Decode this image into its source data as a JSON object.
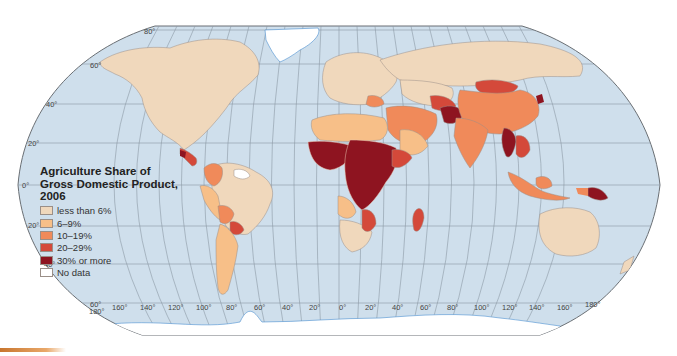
{
  "legend": {
    "title": "Agriculture Share of Gross Domestic Product, 2006",
    "title_lines": [
      "Agriculture Share of",
      "Gross Domestic Product,",
      "2006"
    ],
    "items": [
      {
        "label": "less than 6%",
        "color": "#f0d8bc"
      },
      {
        "label": "6–9%",
        "color": "#f7bf88"
      },
      {
        "label": "10–19%",
        "color": "#f08a5a"
      },
      {
        "label": "20–29%",
        "color": "#d4493a"
      },
      {
        "label": "30% or more",
        "color": "#8e1420"
      },
      {
        "label": "No data",
        "color": "#ffffff"
      }
    ]
  },
  "map": {
    "ocean_color": "#cfdfec",
    "graticule_color": "#8c98a4",
    "coast_color": "#4a8fd0",
    "latitude_labels": [
      {
        "label": "80°",
        "x": 144,
        "y": 34
      },
      {
        "label": "60°",
        "x": 90,
        "y": 68
      },
      {
        "label": "40°",
        "x": 46,
        "y": 107
      },
      {
        "label": "20°",
        "x": 28,
        "y": 145
      },
      {
        "label": "0°",
        "x": 22,
        "y": 188
      },
      {
        "label": "20°",
        "x": 28,
        "y": 228
      },
      {
        "label": "40°",
        "x": 44,
        "y": 267
      },
      {
        "label": "60°",
        "x": 90,
        "y": 306
      }
    ],
    "longitude_labels": [
      {
        "label": "180°",
        "x": 89,
        "y": 313
      },
      {
        "label": "160°",
        "x": 112,
        "y": 310
      },
      {
        "label": "140°",
        "x": 140,
        "y": 310
      },
      {
        "label": "120°",
        "x": 168,
        "y": 310
      },
      {
        "label": "100°",
        "x": 196,
        "y": 310
      },
      {
        "label": "80°",
        "x": 226,
        "y": 310
      },
      {
        "label": "60°",
        "x": 254,
        "y": 310
      },
      {
        "label": "40°",
        "x": 282,
        "y": 310
      },
      {
        "label": "20°",
        "x": 309,
        "y": 310
      },
      {
        "label": "0°",
        "x": 339,
        "y": 310
      },
      {
        "label": "20°",
        "x": 365,
        "y": 310
      },
      {
        "label": "40°",
        "x": 392,
        "y": 310
      },
      {
        "label": "60°",
        "x": 420,
        "y": 310
      },
      {
        "label": "80°",
        "x": 447,
        "y": 310
      },
      {
        "label": "100°",
        "x": 474,
        "y": 310
      },
      {
        "label": "120°",
        "x": 502,
        "y": 310
      },
      {
        "label": "140°",
        "x": 529,
        "y": 310
      },
      {
        "label": "160°",
        "x": 557,
        "y": 310
      },
      {
        "label": "180°",
        "x": 585,
        "y": 307
      }
    ]
  },
  "regions": {
    "north_america": "less than 6%",
    "greenland": "No data",
    "central_america": "20–29%",
    "guianas": "No data",
    "colombia": "10–19%",
    "bolivia": "10–19%",
    "paraguay": "20–29%",
    "brazil": "less than 6%",
    "argentina": "6–9%",
    "europe": "less than 6%",
    "russia": "less than 6%",
    "north_africa": "6–9%",
    "west_africa": "30% or more",
    "central_africa": "30% or more",
    "east_africa": "30% or more",
    "southern_africa": "less than 6%",
    "madagascar": "20–29%",
    "middle_east": "10–19%",
    "central_asia": "20–29%",
    "afghanistan": "30% or more",
    "mongolia": "20–29%",
    "china": "10–19%",
    "india": "10–19%",
    "myanmar": "30% or more",
    "indonesia": "10–19%",
    "papua_new_guinea": "30% or more",
    "australia": "less than 6%",
    "north_korea": "30% or more"
  }
}
